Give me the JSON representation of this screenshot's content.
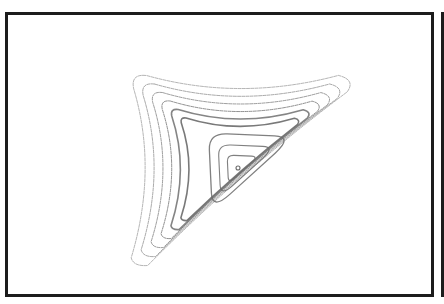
{
  "figure": {
    "frame_color": "#1c1c1c",
    "background_color": "#ffffff",
    "ink_color": "#6a6a6a"
  },
  "plot": {
    "center": {
      "x": 238,
      "y": 168
    },
    "arms": {
      "upper_left_tip": {
        "x": 137,
        "y": 80
      },
      "upper_right_tip": {
        "x": 345,
        "y": 82
      },
      "bottom_tip": {
        "x": 140,
        "y": 260
      }
    },
    "inner_triangle": {
      "top_left": {
        "x": 206,
        "y": 130
      },
      "top_right": {
        "x": 298,
        "y": 134
      },
      "bottom": {
        "x": 210,
        "y": 214
      }
    },
    "inner_orbit_count": 3,
    "outer_orbit_count": 6,
    "axis_labels": [],
    "tick_labels": []
  }
}
